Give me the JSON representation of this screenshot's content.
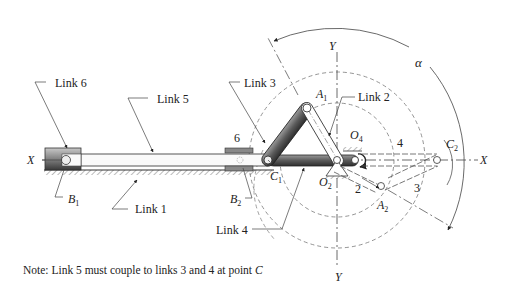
{
  "figure": {
    "labels": {
      "link6": "Link  6",
      "link5": "Link  5",
      "link3": "Link 3",
      "link2": "Link 2",
      "link1": "Link 1",
      "link4": "Link  4",
      "six": "6",
      "four": "4",
      "two": "2",
      "three": "3",
      "x_left": "X",
      "x_right": "X",
      "y_top": "Y",
      "y_bottom": "Y",
      "alpha": "α",
      "A1": "A",
      "A1_sub": "1",
      "A2": "A",
      "A2_sub": "2",
      "B1": "B",
      "B1_sub": "1",
      "B2": "B",
      "B2_sub": "2",
      "C1": "C",
      "C1_sub": "1",
      "C2": "C",
      "C2_sub": "2",
      "O2": "O",
      "O2_sub": "2",
      "O4": "O",
      "O4_sub": "4"
    },
    "note": {
      "prefix": "Note:  Link 5 must couple to links 3 and 4 at point ",
      "point": "C"
    },
    "colors": {
      "line": "#333333",
      "link_fill": "#6e6e6e",
      "link_dark": "#3a3a3a",
      "dashed": "#888888"
    }
  }
}
